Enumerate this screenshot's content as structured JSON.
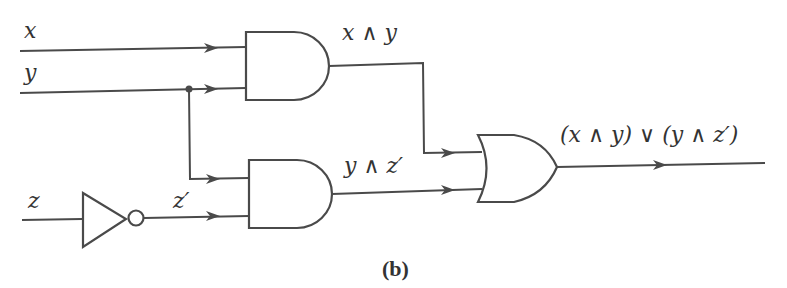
{
  "diagram": {
    "type": "logic-circuit",
    "caption": "(b)",
    "inputs": [
      {
        "name": "x",
        "label": "x"
      },
      {
        "name": "y",
        "label": "y"
      },
      {
        "name": "z",
        "label": "z"
      }
    ],
    "gates": [
      {
        "id": "not1",
        "type": "NOT",
        "inputs": [
          "z"
        ],
        "output_label": "z′"
      },
      {
        "id": "and1",
        "type": "AND",
        "inputs": [
          "x",
          "y"
        ],
        "output_label": "x ∧ y"
      },
      {
        "id": "and2",
        "type": "AND",
        "inputs": [
          "y",
          "z′"
        ],
        "output_label": "y ∧ z′"
      },
      {
        "id": "or1",
        "type": "OR",
        "inputs": [
          "x ∧ y",
          "y ∧ z′"
        ],
        "output_label": "(x ∧ y) ∨ (y ∧ z′)"
      }
    ],
    "labels": {
      "x": "x",
      "y": "y",
      "z": "z",
      "z_prime": "z′",
      "and1_out": "x ∧ y",
      "and2_out": "y ∧ z′",
      "or_out": "(x ∧ y) ∨ (y ∧ z′)"
    },
    "colors": {
      "line": "#4a4a4a",
      "text": "#333333",
      "background": "#ffffff"
    }
  }
}
